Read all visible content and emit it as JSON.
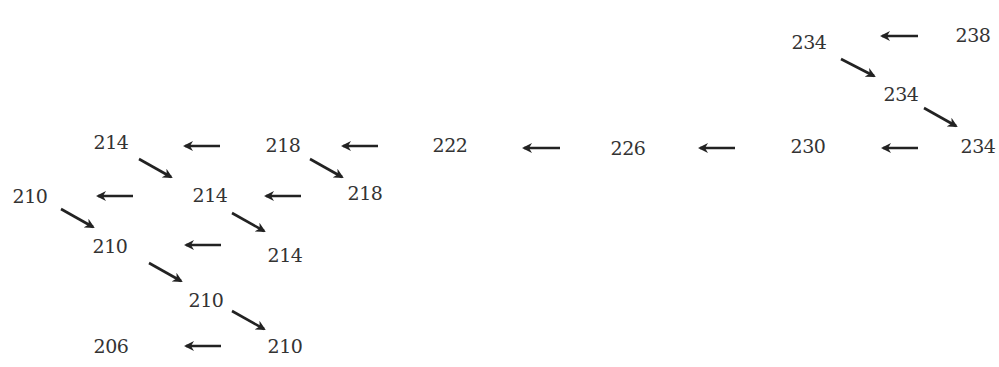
{
  "diagram": {
    "nodes": [
      {
        "label": "238",
        "x": 973,
        "y": 35
      },
      {
        "label": "234",
        "x": 809,
        "y": 42
      },
      {
        "label": "234",
        "x": 901,
        "y": 94
      },
      {
        "label": "234",
        "x": 978,
        "y": 146
      },
      {
        "label": "230",
        "x": 808,
        "y": 146
      },
      {
        "label": "226",
        "x": 628,
        "y": 148
      },
      {
        "label": "222",
        "x": 450,
        "y": 145
      },
      {
        "label": "218",
        "x": 283,
        "y": 145
      },
      {
        "label": "218",
        "x": 365,
        "y": 193
      },
      {
        "label": "214",
        "x": 111,
        "y": 142
      },
      {
        "label": "214",
        "x": 210,
        "y": 195
      },
      {
        "label": "214",
        "x": 285,
        "y": 255
      },
      {
        "label": "210",
        "x": 30,
        "y": 196
      },
      {
        "label": "210",
        "x": 110,
        "y": 246
      },
      {
        "label": "210",
        "x": 206,
        "y": 300
      },
      {
        "label": "210",
        "x": 285,
        "y": 346
      },
      {
        "label": "206",
        "x": 111,
        "y": 346
      }
    ],
    "left_arrows": [
      {
        "x1": 918,
        "y1": 36,
        "x2": 882,
        "y2": 36
      },
      {
        "x1": 918,
        "y1": 148,
        "x2": 883,
        "y2": 148
      },
      {
        "x1": 735,
        "y1": 148,
        "x2": 700,
        "y2": 148
      },
      {
        "x1": 560,
        "y1": 148,
        "x2": 524,
        "y2": 148
      },
      {
        "x1": 378,
        "y1": 146,
        "x2": 343,
        "y2": 146
      },
      {
        "x1": 220,
        "y1": 146,
        "x2": 185,
        "y2": 146
      },
      {
        "x1": 133,
        "y1": 196,
        "x2": 98,
        "y2": 196
      },
      {
        "x1": 301,
        "y1": 196,
        "x2": 266,
        "y2": 196
      },
      {
        "x1": 221,
        "y1": 245,
        "x2": 186,
        "y2": 245
      },
      {
        "x1": 221,
        "y1": 346,
        "x2": 186,
        "y2": 346
      }
    ],
    "diag_arrows": [
      {
        "x1": 841,
        "y1": 59,
        "x2": 874,
        "y2": 76
      },
      {
        "x1": 924,
        "y1": 108,
        "x2": 956,
        "y2": 126
      },
      {
        "x1": 310,
        "y1": 159,
        "x2": 342,
        "y2": 177
      },
      {
        "x1": 139,
        "y1": 159,
        "x2": 171,
        "y2": 177
      },
      {
        "x1": 61,
        "y1": 209,
        "x2": 93,
        "y2": 227
      },
      {
        "x1": 232,
        "y1": 213,
        "x2": 264,
        "y2": 231
      },
      {
        "x1": 149,
        "y1": 263,
        "x2": 181,
        "y2": 281
      },
      {
        "x1": 232,
        "y1": 311,
        "x2": 264,
        "y2": 329
      }
    ]
  }
}
